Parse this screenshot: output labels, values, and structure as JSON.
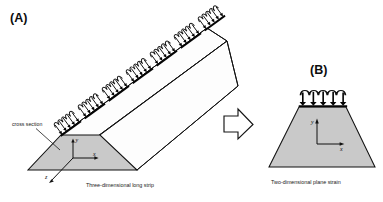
{
  "figure": {
    "background_color": "#ffffff",
    "line_color": "#111111",
    "solid_fill_color": "#c9c9c9",
    "width": 383,
    "height": 202
  },
  "panel_a": {
    "letter": "(A)",
    "caption": "Three-dimensional long strip",
    "annotation": "cross section",
    "axes": {
      "x_label": "x",
      "y_label": "y",
      "z_label": "z"
    },
    "load": {
      "arrow_count_per_set": 5,
      "set_count": 7,
      "direction": "downward",
      "profile": "scalloped"
    }
  },
  "panel_b": {
    "letter": "(B)",
    "caption": "Two-dimensional plane strain",
    "axes": {
      "x_label": "x",
      "y_label": "y"
    },
    "load": {
      "arrow_count": 5,
      "direction": "downward",
      "profile": "scalloped"
    }
  },
  "transition": {
    "icon": "block-arrow-right-icon"
  }
}
